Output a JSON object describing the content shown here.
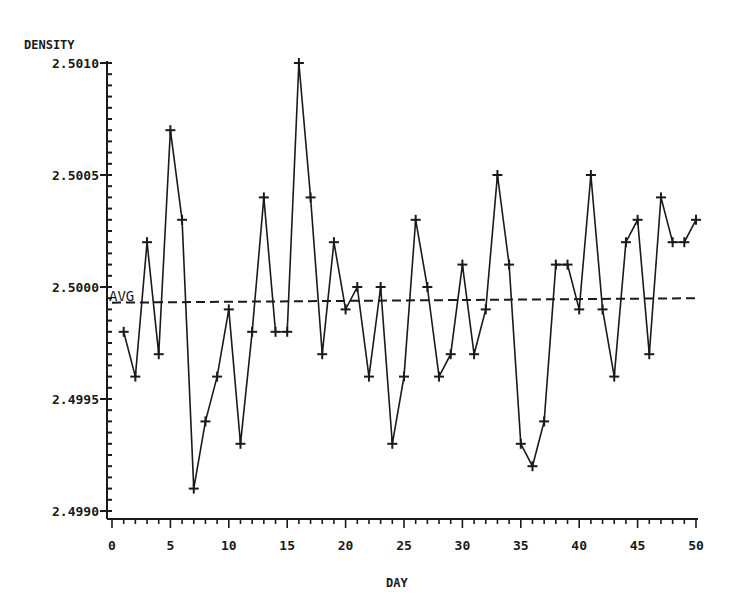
{
  "chart_data": {
    "type": "line",
    "title": "",
    "xlabel": "DAY",
    "ylabel": "DENSITY",
    "xlim": [
      0,
      50
    ],
    "ylim": [
      2.499,
      2.501
    ],
    "x_ticks": [
      "0",
      "5",
      "10",
      "15",
      "20",
      "25",
      "30",
      "35",
      "40",
      "45",
      "50"
    ],
    "y_ticks": [
      "2.4990",
      "2.4995",
      "2.5000",
      "2.5005",
      "2.5010"
    ],
    "grid": false,
    "marker": "plus",
    "x": [
      1,
      2,
      3,
      4,
      5,
      6,
      7,
      8,
      9,
      10,
      11,
      12,
      13,
      14,
      15,
      16,
      17,
      18,
      19,
      20,
      21,
      22,
      23,
      24,
      25,
      26,
      27,
      28,
      29,
      30,
      31,
      32,
      33,
      34,
      35,
      36,
      37,
      38,
      39,
      40,
      41,
      42,
      43,
      44,
      45,
      46,
      47,
      48,
      49,
      50
    ],
    "series": [
      {
        "name": "Density",
        "values": [
          2.4998,
          2.4996,
          2.5002,
          2.4997,
          2.5007,
          2.5003,
          2.4991,
          2.4994,
          2.4996,
          2.4999,
          2.4993,
          2.4998,
          2.5004,
          2.4998,
          2.4998,
          2.501,
          2.5004,
          2.4997,
          2.5002,
          2.4999,
          2.5,
          2.4996,
          2.5,
          2.4993,
          2.4996,
          2.5003,
          2.5,
          2.4996,
          2.4997,
          2.5001,
          2.4997,
          2.4999,
          2.5005,
          2.5001,
          2.4993,
          2.4992,
          2.4994,
          2.5001,
          2.5001,
          2.4999,
          2.5005,
          2.4999,
          2.4996,
          2.5002,
          2.5003,
          2.4997,
          2.5004,
          2.5002,
          2.5002,
          2.5003
        ]
      }
    ],
    "reference_line": {
      "label": "AVG",
      "style": "dashed",
      "x_start": 0,
      "x_end": 50,
      "y_start": 2.49993,
      "y_end": 2.49995
    }
  },
  "axes": {
    "y_title": "DENSITY",
    "x_title": "DAY",
    "avg_label": "AVG"
  }
}
